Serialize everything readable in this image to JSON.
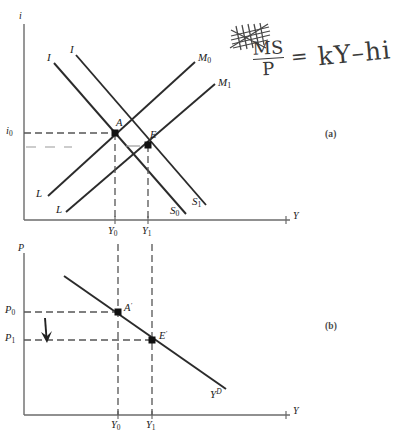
{
  "figure": {
    "title_visible": false,
    "panels": [
      {
        "id": "a",
        "label": "(a)",
        "name": "money-market-panel"
      },
      {
        "id": "b",
        "label": "(b)",
        "name": "aggregate-demand-panel"
      }
    ]
  },
  "panel_a": {
    "label": "(a)",
    "y_axis_label": "i",
    "x_axis_label": "Y",
    "y_ticks": [
      {
        "label": "i",
        "sub": "0",
        "value": "i0"
      }
    ],
    "x_ticks": [
      {
        "label": "Y",
        "sub": "0",
        "value": "Y0"
      },
      {
        "label": "Y",
        "sub": "1",
        "value": "Y1"
      }
    ],
    "curves": [
      {
        "name": "is-curve-0",
        "label": "I",
        "sub": "",
        "slope": "downward",
        "end_label": "S",
        "end_sub": "0"
      },
      {
        "name": "is-curve-1",
        "label": "I",
        "sub": "",
        "slope": "downward",
        "end_label": "S",
        "end_sub": "1"
      },
      {
        "name": "lm-curve-0",
        "label": "L",
        "sub": "",
        "slope": "upward",
        "end_label": "M",
        "end_sub": "0"
      },
      {
        "name": "lm-curve-1",
        "label": "L",
        "sub": "",
        "slope": "upward",
        "end_label": "M",
        "end_sub": "1"
      }
    ],
    "curve_labels": {
      "is_top_left": "I",
      "is_top_right": "I",
      "lm_bottom_left": "L",
      "lm_bottom_right": "L",
      "lm_top_0": "M",
      "lm_top_0_sub": "0",
      "lm_top_1": "M",
      "lm_top_1_sub": "1",
      "is_bottom_0": "S",
      "is_bottom_0_sub": "0",
      "is_bottom_1": "S",
      "is_bottom_1_sub": "1"
    },
    "points": [
      {
        "name": "point-a",
        "label": "A",
        "x_value": "Y0",
        "y_value": "i0"
      },
      {
        "name": "point-e",
        "label": "E",
        "x_value": "Y1",
        "y_value": "below i0"
      }
    ]
  },
  "panel_b": {
    "label": "(b)",
    "y_axis_label": "P",
    "x_axis_label": "Y",
    "y_ticks": [
      {
        "label": "P",
        "sub": "0",
        "value": "P0"
      },
      {
        "label": "P",
        "sub": "1",
        "value": "P1"
      }
    ],
    "x_ticks": [
      {
        "label": "Y",
        "sub": "0",
        "value": "Y0"
      },
      {
        "label": "Y",
        "sub": "1",
        "value": "Y1"
      }
    ],
    "curves": [
      {
        "name": "aggregate-demand-curve",
        "label": "Y",
        "sup": "D",
        "slope": "downward"
      }
    ],
    "curve_label": {
      "base": "Y",
      "sup": "D"
    },
    "points": [
      {
        "name": "point-a-prime",
        "label": "A",
        "prime": "′",
        "x_value": "Y0",
        "y_value": "P0"
      },
      {
        "name": "point-e-prime",
        "label": "E",
        "prime": "′",
        "x_value": "Y1",
        "y_value": "P1"
      }
    ],
    "annotations": [
      {
        "name": "price-decrease-arrow",
        "direction": "down",
        "meaning": "price level falls from P0 to P1"
      }
    ]
  },
  "handwriting": {
    "equation": {
      "numerator": "MS",
      "denominator": "P",
      "equals": "=",
      "right_side": "kY–hi",
      "full_text": "MS/P = kY – hi"
    },
    "scribble": {
      "name": "scribbled-out-correction",
      "text": ""
    }
  },
  "colors": {
    "ink": "#1a1a1a",
    "pencil": "#3a3a3a",
    "dashed": "#555555",
    "axis": "#6b6b6b",
    "panel_label": "#4a4a4a"
  }
}
